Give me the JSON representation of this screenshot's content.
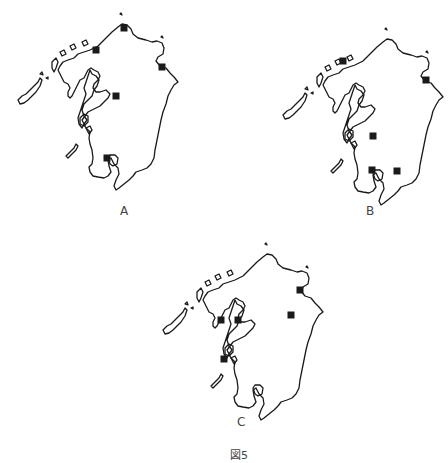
{
  "figure": {
    "caption": "図5",
    "region": "Kyushu",
    "maps": [
      {
        "id": "A",
        "label": "A",
        "offset": [
          0,
          0
        ],
        "markers": [
          [
            124,
            28
          ],
          [
            96,
            50
          ],
          [
            162,
            67
          ],
          [
            116,
            96
          ],
          [
            107,
            158
          ]
        ]
      },
      {
        "id": "B",
        "label": "B",
        "offset": [
          265,
          15
        ],
        "markers": [
          [
            343,
            61
          ],
          [
            426,
            80
          ],
          [
            373,
            136
          ],
          [
            372,
            170
          ],
          [
            397,
            171
          ]
        ]
      },
      {
        "id": "C",
        "label": "C",
        "offset": [
          145,
          230
        ],
        "markers": [
          [
            300,
            290
          ],
          [
            291,
            315
          ],
          [
            221,
            320
          ],
          [
            238,
            320
          ],
          [
            224,
            359
          ]
        ]
      }
    ],
    "marker_color": "#1a1a1a",
    "outline_color": "#1a1a1a"
  }
}
